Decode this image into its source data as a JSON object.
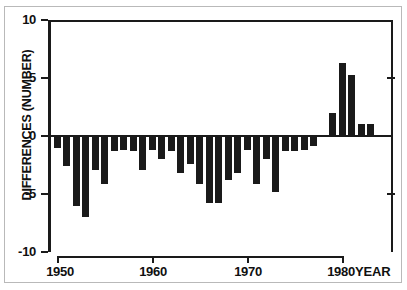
{
  "chart_data": {
    "type": "bar",
    "title": "",
    "xlabel": "YEAR",
    "ylabel": "DIFFERENCES (NUMBER)",
    "ylim": [
      -10,
      10
    ],
    "xlim": [
      1949.3,
      1984.7
    ],
    "grid": false,
    "legend": null,
    "bar_color": "#1a1a1a",
    "background_color": "#ffffff",
    "ytick_labels": [
      "10",
      "5",
      "0",
      "-5",
      "-10"
    ],
    "ytick_values": [
      10,
      5,
      0,
      -5,
      -10
    ],
    "xtick_labels": [
      "1950",
      "1960",
      "1970",
      "1980"
    ],
    "xtick_values": [
      1950,
      1960,
      1970,
      1980
    ],
    "categories": [
      1950,
      1951,
      1952,
      1953,
      1954,
      1955,
      1956,
      1957,
      1958,
      1959,
      1960,
      1961,
      1962,
      1963,
      1964,
      1965,
      1966,
      1967,
      1968,
      1969,
      1970,
      1971,
      1972,
      1973,
      1974,
      1975,
      1976,
      1977,
      1978,
      1979,
      1980,
      1981,
      1982,
      1983,
      1984
    ],
    "values": [
      -1.0,
      -2.6,
      -6.0,
      -7.0,
      -2.9,
      -4.1,
      -1.3,
      -1.2,
      -1.3,
      -2.9,
      -1.2,
      -2.0,
      -1.3,
      -3.2,
      -2.4,
      -4.1,
      -5.8,
      -5.8,
      -3.8,
      -3.2,
      -1.2,
      -4.1,
      -2.0,
      -4.8,
      -1.3,
      -1.3,
      -1.2,
      -0.9,
      0.0,
      2.0,
      6.3,
      5.3,
      1.0,
      1.0,
      0.0
    ]
  }
}
